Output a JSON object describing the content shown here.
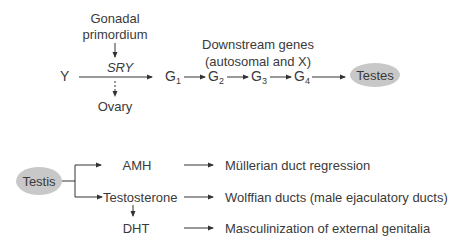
{
  "sex_determination": {
    "gonadal_primordium_line1": "Gonadal",
    "gonadal_primordium_line2": "primordium",
    "sry": "SRY",
    "y_chromosome": "Y",
    "ovary": "Ovary",
    "downstream_line1": "Downstream genes",
    "downstream_line2": "(autosomal and X)",
    "genes": [
      {
        "letter": "G",
        "sub": "1"
      },
      {
        "letter": "G",
        "sub": "2"
      },
      {
        "letter": "G",
        "sub": "3"
      },
      {
        "letter": "G",
        "sub": "4"
      }
    ],
    "testes": "Testes"
  },
  "testis_hormones": {
    "testis": "Testis",
    "rows": [
      {
        "hormone": "AMH",
        "effect": "Müllerian duct regression"
      },
      {
        "hormone": "Testosterone",
        "effect": "Wolffian ducts (male ejaculatory ducts)"
      },
      {
        "hormone": "DHT",
        "effect": "Masculinization of external genitalia"
      }
    ]
  },
  "colors": {
    "node_fill": "#c8c8c8",
    "line": "#333333",
    "text": "#3a3a3a"
  }
}
